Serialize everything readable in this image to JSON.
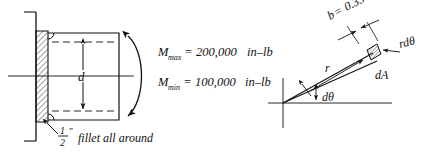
{
  "figure": {
    "left_diagram": {
      "name": "shaft-flange-section",
      "diameter_label": "d",
      "moment_max": "Mmax = 200,000 in–lb",
      "moment_max_parts": {
        "symbol": "M",
        "subscript": "max",
        "equals": "=",
        "value": "200,000",
        "units": "in–lb"
      },
      "moment_min": "Mmin = 100,000 in–lb",
      "moment_min_parts": {
        "symbol": "M",
        "subscript": "min",
        "equals": "=",
        "value": "100,000",
        "units": "in–lb"
      },
      "fillet_note": {
        "numerator": "1",
        "denominator": "2",
        "inch_mark": "”",
        "text": "fillet all around"
      }
    },
    "right_diagram": {
      "name": "differential-area-element",
      "width_label": "b = 0.354",
      "width_label_parts": {
        "symbol": "b",
        "equals": "=",
        "value": "0.354"
      },
      "arc_label": "rdθ",
      "area_label": "dA",
      "radius_label": "r",
      "angle_label": "dθ"
    },
    "colors": {
      "line": "#111111",
      "hatch": "#111111",
      "background": "#ffffff"
    }
  }
}
